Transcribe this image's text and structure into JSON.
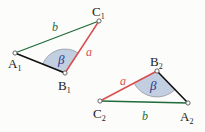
{
  "figure": {
    "background_color": "#fcfcfa",
    "colors": {
      "side_a": "#d94f4f",
      "side_b": "#1f6b3a",
      "side_c": "#111111",
      "angle_fill": "#c2cfe0",
      "angle_stroke": "#8a8f99",
      "angle_label": "#2b2f8f",
      "vertex_label": "#1b1b1b",
      "vertex_marker_stroke": "#555555",
      "vertex_marker_fill": "#ffffff"
    }
  },
  "triangles": [
    {
      "id": "triangle-1",
      "vertices": [
        {
          "name": "A1",
          "label": "A",
          "sub": "1",
          "x": 15,
          "y": 53,
          "label_x": 8,
          "label_y": 68
        },
        {
          "name": "B1",
          "label": "B",
          "sub": "1",
          "x": 65,
          "y": 73,
          "label_x": 58,
          "label_y": 90
        },
        {
          "name": "C1",
          "label": "C",
          "sub": "1",
          "x": 99,
          "y": 21,
          "label_x": 92,
          "label_y": 16
        }
      ],
      "sides": [
        {
          "name": "side-a",
          "label": "a",
          "from": "B1",
          "to": "C1",
          "color": "#d94f4f",
          "label_x": 86,
          "label_y": 56
        },
        {
          "name": "side-b",
          "label": "b",
          "from": "A1",
          "to": "C1",
          "color": "#1f6b3a",
          "label_x": 52,
          "label_y": 31
        },
        {
          "name": "side-c",
          "label": "",
          "from": "A1",
          "to": "B1",
          "color": "#111111",
          "label_x": 0,
          "label_y": 0
        }
      ],
      "angle": {
        "name": "angle-beta-1",
        "label": "β",
        "vertex": "B1",
        "radius": 24,
        "label_x": 58,
        "label_y": 64
      }
    },
    {
      "id": "triangle-2",
      "vertices": [
        {
          "name": "C2",
          "label": "C",
          "sub": "2",
          "x": 100,
          "y": 101,
          "label_x": 93,
          "label_y": 118
        },
        {
          "name": "A2",
          "label": "A",
          "sub": "2",
          "x": 188,
          "y": 103,
          "label_x": 180,
          "label_y": 121
        },
        {
          "name": "B2",
          "label": "B",
          "sub": "2",
          "x": 157,
          "y": 71,
          "label_x": 150,
          "label_y": 66
        }
      ],
      "sides": [
        {
          "name": "side-a",
          "label": "a",
          "from": "C2",
          "to": "B2",
          "color": "#d94f4f",
          "label_x": 120,
          "label_y": 85
        },
        {
          "name": "side-b",
          "label": "b",
          "from": "C2",
          "to": "A2",
          "color": "#1f6b3a",
          "label_x": 142,
          "label_y": 120
        },
        {
          "name": "side-c",
          "label": "",
          "from": "B2",
          "to": "A2",
          "color": "#111111",
          "label_x": 0,
          "label_y": 0
        }
      ],
      "angle": {
        "name": "angle-beta-2",
        "label": "β",
        "vertex": "B2",
        "radius": 26,
        "label_x": 150,
        "label_y": 90
      }
    }
  ]
}
